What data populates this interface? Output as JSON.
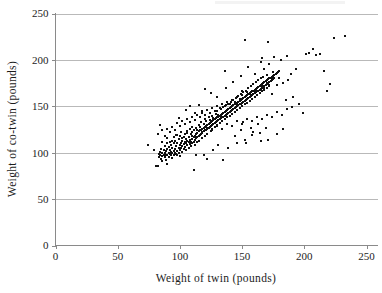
{
  "chart_data": {
    "type": "scatter",
    "title": "",
    "subtitle": "",
    "xlabel": "Weight of twin (pounds)",
    "ylabel": "Weight of co-twin (pounds)",
    "xlim": [
      0,
      258
    ],
    "ylim": [
      0,
      250
    ],
    "xticks": [
      0,
      50,
      100,
      150,
      200,
      250
    ],
    "yticks": [
      0,
      50,
      100,
      150,
      200,
      250
    ],
    "xtick_labels": [
      "0",
      "50",
      "100",
      "150",
      "200",
      "250"
    ],
    "ytick_labels": [
      "0",
      "50",
      "100",
      "150",
      "200",
      "250"
    ],
    "grid": "horizontal",
    "legend": "none",
    "marker": "square",
    "marker_color": "#111111",
    "marker_size_px": 2,
    "grid_color": "#b9b9b9",
    "axis_color": "#8a8a8a",
    "background": "#ffffff",
    "n_points": 430,
    "points": [
      [
        74,
        108
      ],
      [
        79,
        103
      ],
      [
        81,
        86
      ],
      [
        82,
        86
      ],
      [
        83,
        99
      ],
      [
        83,
        95
      ],
      [
        84,
        101
      ],
      [
        84,
        97
      ],
      [
        85,
        93
      ],
      [
        85,
        104
      ],
      [
        86,
        100
      ],
      [
        86,
        96
      ],
      [
        86,
        91
      ],
      [
        87,
        98
      ],
      [
        87,
        103
      ],
      [
        88,
        95
      ],
      [
        88,
        100
      ],
      [
        88,
        107
      ],
      [
        89,
        92
      ],
      [
        89,
        97
      ],
      [
        89,
        102
      ],
      [
        90,
        98
      ],
      [
        90,
        104
      ],
      [
        90,
        110
      ],
      [
        90,
        88
      ],
      [
        91,
        100
      ],
      [
        91,
        95
      ],
      [
        91,
        106
      ],
      [
        92,
        99
      ],
      [
        92,
        103
      ],
      [
        92,
        112
      ],
      [
        93,
        97
      ],
      [
        93,
        101
      ],
      [
        93,
        108
      ],
      [
        94,
        100
      ],
      [
        94,
        105
      ],
      [
        94,
        94
      ],
      [
        95,
        102
      ],
      [
        95,
        98
      ],
      [
        95,
        110
      ],
      [
        95,
        117
      ],
      [
        96,
        104
      ],
      [
        96,
        100
      ],
      [
        96,
        113
      ],
      [
        97,
        99
      ],
      [
        97,
        107
      ],
      [
        97,
        119
      ],
      [
        98,
        102
      ],
      [
        98,
        110
      ],
      [
        98,
        97
      ],
      [
        99,
        105
      ],
      [
        99,
        115
      ],
      [
        99,
        100
      ],
      [
        100,
        108
      ],
      [
        100,
        103
      ],
      [
        100,
        118
      ],
      [
        100,
        96
      ],
      [
        101,
        110
      ],
      [
        101,
        105
      ],
      [
        101,
        122
      ],
      [
        102,
        107
      ],
      [
        102,
        113
      ],
      [
        102,
        101
      ],
      [
        103,
        109
      ],
      [
        103,
        117
      ],
      [
        103,
        104
      ],
      [
        104,
        112
      ],
      [
        104,
        106
      ],
      [
        104,
        120
      ],
      [
        105,
        110
      ],
      [
        105,
        115
      ],
      [
        105,
        103
      ],
      [
        106,
        113
      ],
      [
        106,
        108
      ],
      [
        106,
        123
      ],
      [
        107,
        111
      ],
      [
        107,
        117
      ],
      [
        107,
        105
      ],
      [
        108,
        114
      ],
      [
        108,
        109
      ],
      [
        108,
        126
      ],
      [
        109,
        112
      ],
      [
        109,
        120
      ],
      [
        109,
        107
      ],
      [
        110,
        115
      ],
      [
        110,
        110
      ],
      [
        110,
        128
      ],
      [
        110,
        122
      ],
      [
        111,
        117
      ],
      [
        111,
        112
      ],
      [
        111,
        124
      ],
      [
        112,
        118
      ],
      [
        112,
        114
      ],
      [
        112,
        108
      ],
      [
        113,
        120
      ],
      [
        113,
        116
      ],
      [
        113,
        127
      ],
      [
        114,
        121
      ],
      [
        114,
        117
      ],
      [
        114,
        111
      ],
      [
        115,
        123
      ],
      [
        115,
        118
      ],
      [
        115,
        130
      ],
      [
        115,
        113
      ],
      [
        116,
        124
      ],
      [
        116,
        119
      ],
      [
        116,
        128
      ],
      [
        117,
        125
      ],
      [
        117,
        120
      ],
      [
        117,
        133
      ],
      [
        118,
        126
      ],
      [
        118,
        122
      ],
      [
        118,
        116
      ],
      [
        119,
        127
      ],
      [
        119,
        123
      ],
      [
        119,
        131
      ],
      [
        120,
        128
      ],
      [
        120,
        124
      ],
      [
        120,
        136
      ],
      [
        120,
        118
      ],
      [
        121,
        129
      ],
      [
        121,
        125
      ],
      [
        121,
        134
      ],
      [
        122,
        130
      ],
      [
        122,
        126
      ],
      [
        122,
        120
      ],
      [
        123,
        131
      ],
      [
        123,
        127
      ],
      [
        123,
        138
      ],
      [
        124,
        132
      ],
      [
        124,
        128
      ],
      [
        124,
        135
      ],
      [
        125,
        133
      ],
      [
        125,
        129
      ],
      [
        125,
        123
      ],
      [
        126,
        134
      ],
      [
        126,
        130
      ],
      [
        126,
        140
      ],
      [
        126,
        126
      ],
      [
        127,
        135
      ],
      [
        127,
        131
      ],
      [
        127,
        137
      ],
      [
        128,
        136
      ],
      [
        128,
        132
      ],
      [
        128,
        128
      ],
      [
        129,
        137
      ],
      [
        129,
        133
      ],
      [
        129,
        142
      ],
      [
        130,
        138
      ],
      [
        130,
        134
      ],
      [
        130,
        130
      ],
      [
        130,
        145
      ],
      [
        131,
        139
      ],
      [
        131,
        135
      ],
      [
        131,
        141
      ],
      [
        132,
        140
      ],
      [
        132,
        136
      ],
      [
        132,
        132
      ],
      [
        133,
        141
      ],
      [
        133,
        137
      ],
      [
        133,
        147
      ],
      [
        134,
        142
      ],
      [
        134,
        138
      ],
      [
        134,
        134
      ],
      [
        135,
        143
      ],
      [
        135,
        139
      ],
      [
        135,
        149
      ],
      [
        136,
        144
      ],
      [
        136,
        140
      ],
      [
        136,
        136
      ],
      [
        137,
        145
      ],
      [
        137,
        141
      ],
      [
        137,
        151
      ],
      [
        138,
        146
      ],
      [
        138,
        142
      ],
      [
        138,
        138
      ],
      [
        139,
        147
      ],
      [
        139,
        143
      ],
      [
        139,
        153
      ],
      [
        140,
        148
      ],
      [
        140,
        144
      ],
      [
        140,
        140
      ],
      [
        141,
        149
      ],
      [
        141,
        145
      ],
      [
        141,
        155
      ],
      [
        142,
        150
      ],
      [
        142,
        146
      ],
      [
        142,
        142
      ],
      [
        143,
        151
      ],
      [
        143,
        147
      ],
      [
        143,
        157
      ],
      [
        144,
        152
      ],
      [
        144,
        148
      ],
      [
        144,
        144
      ],
      [
        145,
        153
      ],
      [
        145,
        149
      ],
      [
        145,
        159
      ],
      [
        146,
        154
      ],
      [
        146,
        150
      ],
      [
        146,
        146
      ],
      [
        147,
        155
      ],
      [
        147,
        151
      ],
      [
        147,
        161
      ],
      [
        148,
        156
      ],
      [
        148,
        152
      ],
      [
        148,
        148
      ],
      [
        149,
        157
      ],
      [
        149,
        153
      ],
      [
        149,
        163
      ],
      [
        150,
        158
      ],
      [
        150,
        154
      ],
      [
        150,
        150
      ],
      [
        150,
        166
      ],
      [
        151,
        159
      ],
      [
        151,
        155
      ],
      [
        151,
        165
      ],
      [
        152,
        160
      ],
      [
        152,
        156
      ],
      [
        152,
        152
      ],
      [
        153,
        161
      ],
      [
        153,
        157
      ],
      [
        153,
        167
      ],
      [
        154,
        162
      ],
      [
        154,
        158
      ],
      [
        154,
        154
      ],
      [
        155,
        163
      ],
      [
        155,
        159
      ],
      [
        155,
        170
      ],
      [
        156,
        164
      ],
      [
        156,
        160
      ],
      [
        156,
        156
      ],
      [
        157,
        165
      ],
      [
        157,
        161
      ],
      [
        157,
        172
      ],
      [
        158,
        166
      ],
      [
        158,
        162
      ],
      [
        158,
        158
      ],
      [
        159,
        167
      ],
      [
        159,
        163
      ],
      [
        159,
        174
      ],
      [
        160,
        168
      ],
      [
        160,
        164
      ],
      [
        160,
        160
      ],
      [
        161,
        169
      ],
      [
        161,
        165
      ],
      [
        161,
        176
      ],
      [
        162,
        170
      ],
      [
        162,
        166
      ],
      [
        162,
        162
      ],
      [
        163,
        171
      ],
      [
        163,
        167
      ],
      [
        163,
        178
      ],
      [
        164,
        172
      ],
      [
        164,
        168
      ],
      [
        164,
        164
      ],
      [
        165,
        173
      ],
      [
        165,
        169
      ],
      [
        165,
        180
      ],
      [
        166,
        174
      ],
      [
        166,
        170
      ],
      [
        166,
        166
      ],
      [
        167,
        175
      ],
      [
        167,
        171
      ],
      [
        167,
        182
      ],
      [
        168,
        176
      ],
      [
        168,
        172
      ],
      [
        168,
        168
      ],
      [
        169,
        177
      ],
      [
        169,
        173
      ],
      [
        170,
        178
      ],
      [
        170,
        174
      ],
      [
        170,
        170
      ],
      [
        171,
        179
      ],
      [
        171,
        175
      ],
      [
        172,
        180
      ],
      [
        172,
        176
      ],
      [
        172,
        172
      ],
      [
        173,
        181
      ],
      [
        173,
        177
      ],
      [
        174,
        182
      ],
      [
        174,
        178
      ],
      [
        175,
        183
      ],
      [
        175,
        179
      ],
      [
        176,
        184
      ],
      [
        176,
        180
      ],
      [
        177,
        185
      ],
      [
        178,
        186
      ],
      [
        179,
        187
      ],
      [
        180,
        188
      ],
      [
        82,
        120
      ],
      [
        84,
        130
      ],
      [
        86,
        125
      ],
      [
        88,
        118
      ],
      [
        90,
        126
      ],
      [
        92,
        122
      ],
      [
        94,
        128
      ],
      [
        96,
        124
      ],
      [
        98,
        132
      ],
      [
        100,
        129
      ],
      [
        102,
        134
      ],
      [
        104,
        131
      ],
      [
        106,
        136
      ],
      [
        108,
        133
      ],
      [
        110,
        138
      ],
      [
        112,
        135
      ],
      [
        114,
        141
      ],
      [
        116,
        139
      ],
      [
        118,
        143
      ],
      [
        120,
        141
      ],
      [
        122,
        146
      ],
      [
        124,
        143
      ],
      [
        126,
        148
      ],
      [
        128,
        145
      ],
      [
        130,
        150
      ],
      [
        132,
        148
      ],
      [
        134,
        152
      ],
      [
        136,
        150
      ],
      [
        138,
        155
      ],
      [
        140,
        153
      ],
      [
        142,
        157
      ],
      [
        144,
        155
      ],
      [
        146,
        160
      ],
      [
        148,
        158
      ],
      [
        150,
        162
      ],
      [
        152,
        160
      ],
      [
        154,
        165
      ],
      [
        156,
        163
      ],
      [
        158,
        167
      ],
      [
        160,
        165
      ],
      [
        162,
        170
      ],
      [
        164,
        168
      ],
      [
        166,
        172
      ],
      [
        168,
        170
      ],
      [
        170,
        175
      ],
      [
        172,
        173
      ],
      [
        174,
        178
      ],
      [
        86,
        112
      ],
      [
        90,
        116
      ],
      [
        94,
        113
      ],
      [
        98,
        119
      ],
      [
        102,
        116
      ],
      [
        106,
        121
      ],
      [
        110,
        118
      ],
      [
        114,
        124
      ],
      [
        118,
        121
      ],
      [
        122,
        127
      ],
      [
        126,
        124
      ],
      [
        130,
        129
      ],
      [
        134,
        126
      ],
      [
        138,
        131
      ],
      [
        142,
        129
      ],
      [
        146,
        134
      ],
      [
        150,
        131
      ],
      [
        154,
        136
      ],
      [
        158,
        134
      ],
      [
        162,
        139
      ],
      [
        166,
        136
      ],
      [
        170,
        141
      ],
      [
        174,
        139
      ],
      [
        178,
        144
      ],
      [
        182,
        141
      ],
      [
        186,
        147
      ],
      [
        111,
        81
      ],
      [
        122,
        93
      ],
      [
        135,
        92
      ],
      [
        113,
        98
      ],
      [
        119,
        97
      ],
      [
        127,
        103
      ],
      [
        131,
        108
      ],
      [
        139,
        105
      ],
      [
        146,
        110
      ],
      [
        152,
        114
      ],
      [
        158,
        119
      ],
      [
        164,
        121
      ],
      [
        157,
        127
      ],
      [
        151,
        133
      ],
      [
        144,
        118
      ],
      [
        149,
        124
      ],
      [
        163,
        131
      ],
      [
        169,
        127
      ],
      [
        108,
        150
      ],
      [
        115,
        151
      ],
      [
        120,
        169
      ],
      [
        125,
        164
      ],
      [
        130,
        160
      ],
      [
        118,
        145
      ],
      [
        112,
        143
      ],
      [
        105,
        146
      ],
      [
        99,
        137
      ],
      [
        136,
        188
      ],
      [
        152,
        221
      ],
      [
        171,
        219
      ],
      [
        176,
        203
      ],
      [
        181,
        200
      ],
      [
        186,
        204
      ],
      [
        189,
        185
      ],
      [
        193,
        190
      ],
      [
        196,
        152
      ],
      [
        199,
        143
      ],
      [
        201,
        206
      ],
      [
        204,
        207
      ],
      [
        207,
        212
      ],
      [
        209,
        205
      ],
      [
        213,
        206
      ],
      [
        216,
        188
      ],
      [
        218,
        167
      ],
      [
        221,
        174
      ],
      [
        224,
        224
      ],
      [
        233,
        226
      ],
      [
        178,
        173
      ],
      [
        183,
        175
      ],
      [
        187,
        178
      ],
      [
        191,
        160
      ],
      [
        174,
        163
      ],
      [
        168,
        190
      ],
      [
        172,
        196
      ],
      [
        165,
        198
      ],
      [
        160,
        185
      ],
      [
        155,
        192
      ],
      [
        149,
        183
      ],
      [
        143,
        176
      ],
      [
        137,
        170
      ],
      [
        166,
        202
      ],
      [
        170,
        184
      ],
      [
        175,
        187
      ],
      [
        180,
        181
      ],
      [
        185,
        157
      ],
      [
        190,
        149
      ],
      [
        178,
        120
      ],
      [
        183,
        126
      ],
      [
        171,
        114
      ],
      [
        165,
        113
      ],
      [
        159,
        122
      ],
      [
        153,
        110
      ]
    ]
  },
  "axes": {
    "x_axis_name": "x-axis",
    "y_axis_name": "y-axis"
  }
}
